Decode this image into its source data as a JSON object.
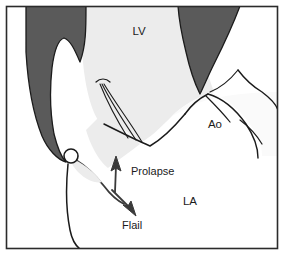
{
  "figure": {
    "frame": {
      "border_color": "#2b2b2b",
      "background_color": "#ffffff"
    },
    "colors": {
      "myocardium": "#5a5a5a",
      "lv_cavity": "#ececec",
      "la_cavity": "#ffffff",
      "aorta_cavity": "#fafafa",
      "outline": "#1b1b1b",
      "arrow": "#3a3a3a",
      "text": "#1b1b1b"
    },
    "chamber_labels": [
      {
        "id": "lv",
        "text": "LV",
        "x": 139,
        "y": 35
      },
      {
        "id": "ao",
        "text": "Ao",
        "x": 215,
        "y": 128
      },
      {
        "id": "la",
        "text": "LA",
        "x": 190,
        "y": 205
      }
    ],
    "annotations": [
      {
        "id": "prolapse",
        "text": "Prolapse",
        "x": 131,
        "y": 175
      },
      {
        "id": "flail",
        "text": "Flail",
        "x": 122,
        "y": 229
      }
    ],
    "structures": [
      {
        "id": "left-myocardium",
        "name": "left ventricular myocardium and papillary muscle"
      },
      {
        "id": "right-myocardium",
        "name": "right ventricular myocardium wedge"
      },
      {
        "id": "lv-cavity",
        "name": "left ventricular cavity"
      },
      {
        "id": "la-cavity",
        "name": "left atrial cavity"
      },
      {
        "id": "aortic-root",
        "name": "aortic root"
      },
      {
        "id": "chordae-tendineae",
        "name": "chordae tendineae"
      },
      {
        "id": "anterior-leaflet",
        "name": "anterior mitral leaflet"
      },
      {
        "id": "flail-leaflet",
        "name": "flail posterior mitral leaflet"
      },
      {
        "id": "mitral-annulus",
        "name": "mitral annulus hinge point"
      }
    ],
    "arrows": [
      {
        "id": "prolapse-arrow",
        "direction": "up",
        "points_to": "left atrium"
      },
      {
        "id": "flail-arrow",
        "direction": "down",
        "points_to": "left atrium"
      }
    ]
  }
}
